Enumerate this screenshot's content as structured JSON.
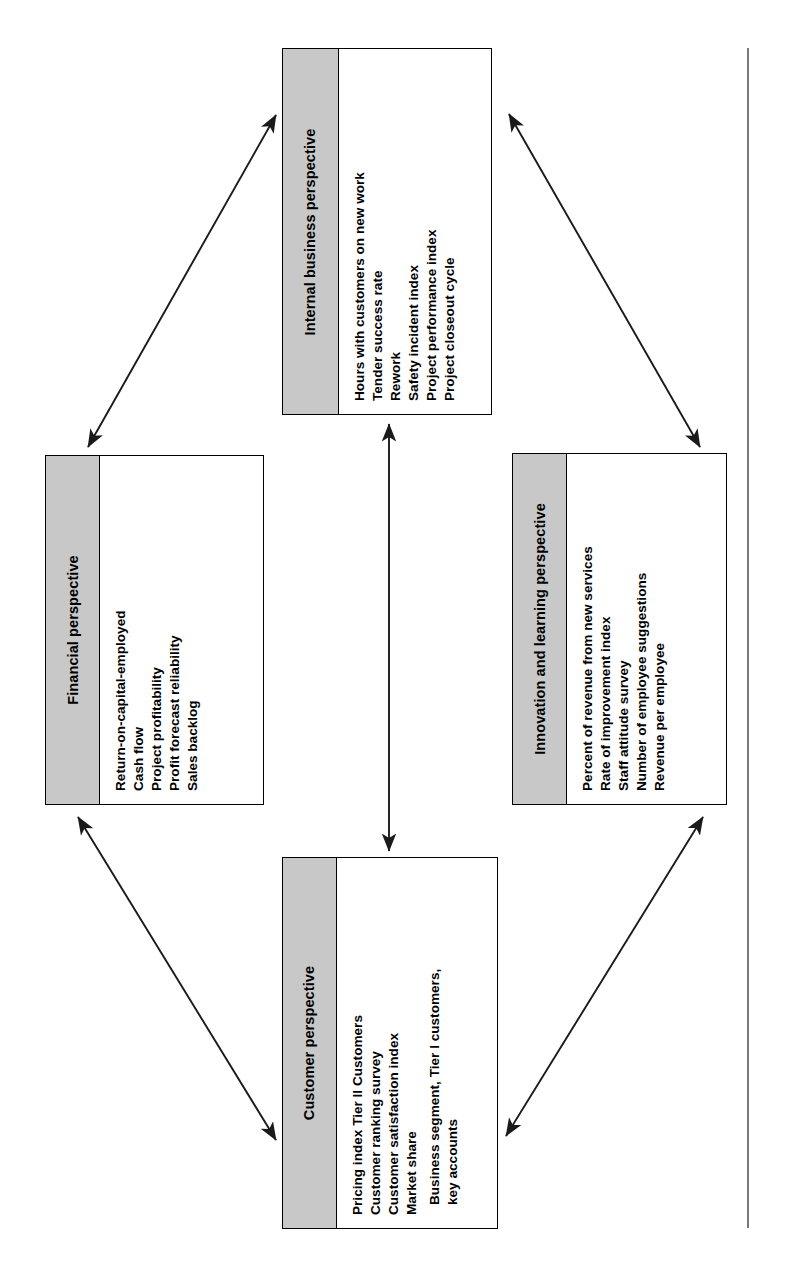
{
  "diagram": {
    "layout": "diamond",
    "orientation": "rotated-90-ccw",
    "colors": {
      "header_fill": "#c8c8c8",
      "box_border": "#000000",
      "box_fill": "#ffffff",
      "arrow": "#1a1a1a",
      "text": "#000000"
    },
    "boxes": [
      {
        "id": "internal-business",
        "title": "Internal business perspective",
        "measures": [
          {
            "text": "Hours with customers on new work",
            "indent": false
          },
          {
            "text": "Tender success rate",
            "indent": false
          },
          {
            "text": "Rework",
            "indent": false
          },
          {
            "text": "Safety incident index",
            "indent": false
          },
          {
            "text": "Project performance index",
            "indent": false
          },
          {
            "text": "Project closeout cycle",
            "indent": false
          }
        ]
      },
      {
        "id": "financial",
        "title": "Financial perspective",
        "measures": [
          {
            "text": "Return-on-capital-employed",
            "indent": false
          },
          {
            "text": "Cash flow",
            "indent": false
          },
          {
            "text": "Project profitability",
            "indent": false
          },
          {
            "text": "Profit forecast reliability",
            "indent": false
          },
          {
            "text": "Sales backlog",
            "indent": false
          }
        ]
      },
      {
        "id": "innovation-learning",
        "title": "Innovation and learning perspective",
        "measures": [
          {
            "text": "Percent of revenue from new services",
            "indent": false
          },
          {
            "text": "Rate of improvement index",
            "indent": false
          },
          {
            "text": "Staff attitude survey",
            "indent": false
          },
          {
            "text": "Number of employee suggestions",
            "indent": false
          },
          {
            "text": "Revenue per employee",
            "indent": false
          }
        ]
      },
      {
        "id": "customer",
        "title": "Customer perspective",
        "measures": [
          {
            "text": "Pricing index Tier II Customers",
            "indent": false
          },
          {
            "text": "Customer ranking survey",
            "indent": false
          },
          {
            "text": "Customer satisfaction index",
            "indent": false
          },
          {
            "text": "Market share",
            "indent": false
          },
          {
            "text": "Business segment, Tier I customers,",
            "indent": true
          },
          {
            "text": "key accounts",
            "indent": true
          }
        ]
      }
    ],
    "connectors": [
      {
        "id": "financial-internal",
        "from": "financial",
        "to": "internal-business",
        "style": "double-headed"
      },
      {
        "id": "internal-innovation",
        "from": "internal-business",
        "to": "innovation-learning",
        "style": "double-headed"
      },
      {
        "id": "financial-customer",
        "from": "financial",
        "to": "customer",
        "style": "double-headed"
      },
      {
        "id": "customer-innovation",
        "from": "customer",
        "to": "innovation-learning",
        "style": "double-headed"
      },
      {
        "id": "internal-customer",
        "from": "internal-business",
        "to": "customer",
        "style": "double-headed"
      }
    ]
  }
}
